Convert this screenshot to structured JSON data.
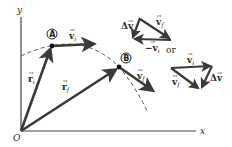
{
  "diagram": {
    "type": "kinematics-vector-diagram",
    "axes": {
      "x_label": "x",
      "y_label": "y",
      "origin_label": "O"
    },
    "points": {
      "A": {
        "label": "A",
        "pos": [
          52,
          46
        ]
      },
      "B": {
        "label": "B",
        "pos": [
          119,
          67
        ]
      }
    },
    "vectors": {
      "r_i": {
        "label": "r",
        "sub": "i",
        "from": [
          21,
          131
        ],
        "to": [
          52,
          46
        ]
      },
      "r_f": {
        "label": "r",
        "sub": "f",
        "from": [
          21,
          131
        ],
        "to": [
          119,
          67
        ]
      },
      "v_i_at_A": {
        "label": "v",
        "sub": "i",
        "from": [
          52,
          46
        ],
        "to": [
          96,
          44
        ]
      },
      "v_f_at_B": {
        "label": "v",
        "sub": "f",
        "from": [
          119,
          67
        ],
        "to": [
          155,
          92
        ]
      }
    },
    "trajectory": {
      "style": "dashed",
      "path": "M21 56 Q 80 28 118 66 Q 135 85 148 113"
    },
    "triangle_top": {
      "delta_v_label": "Δv",
      "v_f_label": "v",
      "v_f_sub": "f",
      "neg_v_i_label": "−v",
      "neg_v_i_sub": "i"
    },
    "or_label": "or",
    "triangle_bottom": {
      "v_i_label": "v",
      "v_i_sub": "i",
      "v_f_label": "v",
      "v_f_sub": "f",
      "delta_v_label": "Δv"
    },
    "colors": {
      "ink": "#3a3a3a",
      "background": "#ffffff"
    }
  }
}
